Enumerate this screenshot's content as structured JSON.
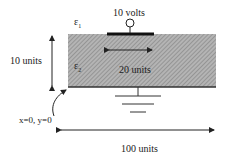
{
  "labels": {
    "voltage": "10 volts",
    "eps1": "ε",
    "eps1_sub": "1",
    "eps2": "ε",
    "eps2_sub": "2",
    "height": "10 units",
    "strip_width": "20 units",
    "origin": "x=0, y=0",
    "width": "100 units"
  },
  "colors": {
    "dielectric_fill": "#a8a8a8",
    "line": "#222222"
  }
}
